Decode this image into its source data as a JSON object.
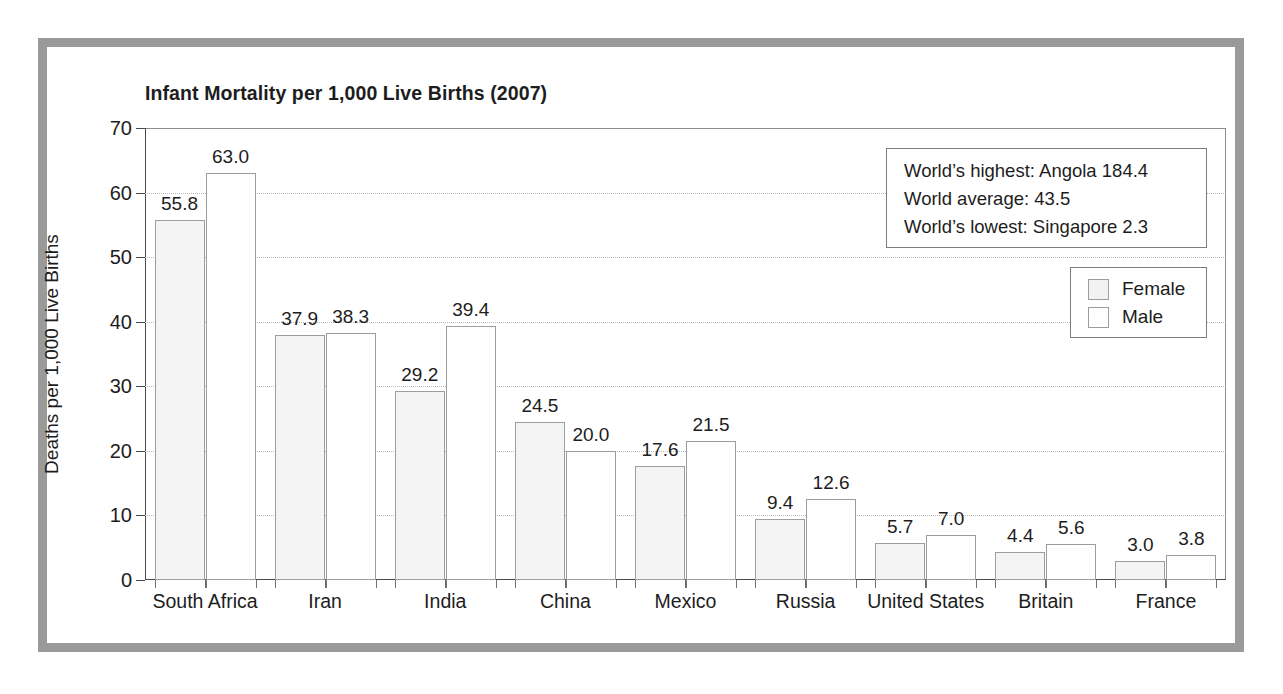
{
  "chart_data": {
    "type": "bar",
    "title": "Infant Mortality per 1,000 Live Births (2007)",
    "xlabel": "",
    "ylabel": "Deaths per 1,000 Live Births",
    "ylim": [
      0,
      70
    ],
    "ytick_step": 10,
    "yticks": [
      0,
      10,
      20,
      30,
      40,
      50,
      60,
      70
    ],
    "grid": "horizontal-dotted",
    "legend_position": "top-right",
    "categories": [
      "South Africa",
      "Iran",
      "India",
      "China",
      "Mexico",
      "Russia",
      "United States",
      "Britain",
      "France"
    ],
    "series": [
      {
        "name": "Female",
        "color": "#f4f4f4",
        "values": [
          55.8,
          37.9,
          29.2,
          24.5,
          17.6,
          9.4,
          5.7,
          4.4,
          3.0
        ],
        "labels": [
          "55.8",
          "37.9",
          "29.2",
          "24.5",
          "17.6",
          "9.4",
          "5.7",
          "4.4",
          "3.0"
        ]
      },
      {
        "name": "Male",
        "color": "#ffffff",
        "values": [
          63.0,
          38.3,
          39.4,
          20.0,
          21.5,
          12.6,
          7.0,
          5.6,
          3.8
        ],
        "labels": [
          "63.0",
          "38.3",
          "39.4",
          "20.0",
          "21.5",
          "12.6",
          "7.0",
          "5.6",
          "3.8"
        ]
      }
    ],
    "annotations": [
      "World’s highest: Angola 184.4",
      "World average: 43.5",
      "World’s lowest: Singapore 2.3"
    ]
  }
}
